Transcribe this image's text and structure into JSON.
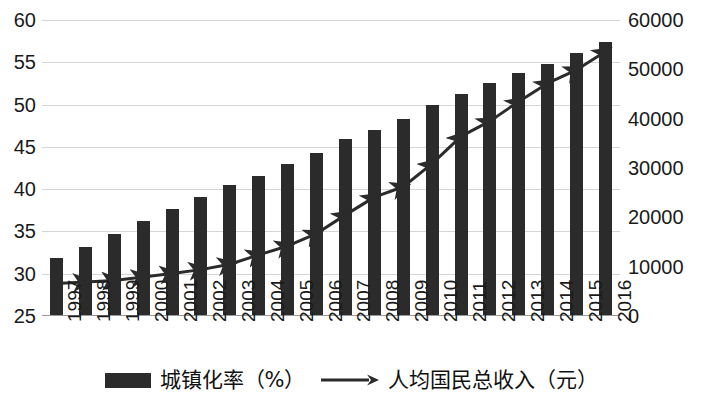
{
  "chart_data": {
    "type": "bar",
    "title": "",
    "xlabel": "",
    "ylabel": "",
    "grid": true,
    "legend_position": "bottom",
    "categories": [
      "1997",
      "1998",
      "1999",
      "2000",
      "2001",
      "2002",
      "2003",
      "2004",
      "2005",
      "2006",
      "2007",
      "2008",
      "2009",
      "2010",
      "2011",
      "2012",
      "2013",
      "2014",
      "2015",
      "2016"
    ],
    "axes": {
      "left": {
        "label": "",
        "min": 25,
        "max": 60,
        "step": 5,
        "ticks": [
          "25",
          "30",
          "35",
          "40",
          "45",
          "50",
          "55",
          "60"
        ]
      },
      "right": {
        "label": "",
        "min": 0,
        "max": 60000,
        "step": 10000,
        "ticks": [
          "0",
          "10000",
          "20000",
          "30000",
          "40000",
          "50000",
          "60000"
        ]
      }
    },
    "series": [
      {
        "name": "城镇化率（%）",
        "kind": "bar",
        "axis": "left",
        "color": "#2b2b2b",
        "values": [
          31.9,
          33.2,
          34.7,
          36.2,
          37.7,
          39.1,
          40.5,
          41.6,
          43.0,
          44.3,
          45.9,
          47.0,
          48.3,
          50.0,
          51.3,
          52.6,
          53.7,
          54.8,
          56.1,
          57.4
        ]
      },
      {
        "name": "人均国民总收入（元）",
        "kind": "line",
        "axis": "right",
        "color": "#2b2b2b",
        "marker": "arrow",
        "values": [
          6600,
          6900,
          7200,
          7900,
          8600,
          9400,
          10500,
          12400,
          14200,
          16700,
          20500,
          24100,
          26200,
          30900,
          36400,
          39500,
          43500,
          47200,
          49900,
          53600
        ]
      }
    ]
  },
  "legend": {
    "entries": [
      {
        "label": "城镇化率（%）",
        "marker": "bar-swatch"
      },
      {
        "label": "人均国民总收入（元）",
        "marker": "arrow-line"
      }
    ]
  }
}
